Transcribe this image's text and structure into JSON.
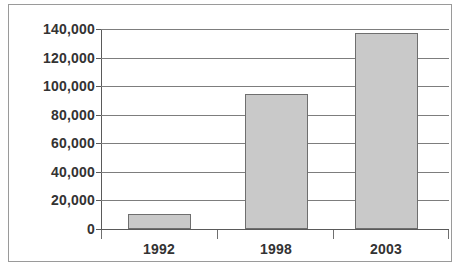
{
  "chart_data": {
    "type": "bar",
    "title": "",
    "subtitle": "",
    "xlabel": "",
    "ylabel": "",
    "categories": [
      "1992",
      "1998",
      "2003"
    ],
    "values": [
      10500,
      94500,
      137500
    ],
    "series": [
      {
        "name": "",
        "values": [
          10500,
          94500,
          137500
        ]
      }
    ],
    "ylim": [
      0,
      140000
    ],
    "y_ticks": [
      0,
      20000,
      40000,
      60000,
      80000,
      100000,
      120000,
      140000
    ],
    "y_tick_labels": [
      "0",
      "20,000",
      "40,000",
      "60,000",
      "80,000",
      "100,000",
      "120,000",
      "140,000"
    ],
    "grid": true,
    "grid_axis": "y",
    "legend": false,
    "legend_position": "none",
    "bar_color": "#c9c9c9",
    "bar_border_color": "#6f6f6f",
    "axis_color": "#5a5a5a",
    "gridline_color": "#7d7d7d",
    "text_color": "#333333",
    "background_color": "#ffffff",
    "frame_border_color": "#9a9a9a",
    "annotations": []
  }
}
